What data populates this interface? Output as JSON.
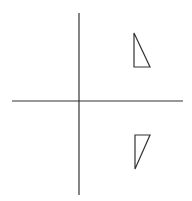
{
  "diagram": {
    "type": "coordinate-reflection",
    "width": 192,
    "height": 201,
    "stroke_color": "#333333",
    "background": "#ffffff",
    "axes": {
      "origin": [
        79,
        101
      ],
      "x_axis": {
        "from": [
          12,
          101
        ],
        "to": [
          183,
          101
        ]
      },
      "y_axis": {
        "from": [
          79,
          13
        ],
        "to": [
          79,
          195
        ]
      }
    },
    "shapes": [
      {
        "name": "upper-triangle",
        "quadrant": "I",
        "points": [
          [
            134,
            33
          ],
          [
            134,
            67
          ],
          [
            150,
            67
          ]
        ]
      },
      {
        "name": "lower-triangle",
        "quadrant": "IV",
        "points": [
          [
            135,
            135
          ],
          [
            150,
            135
          ],
          [
            135,
            169
          ]
        ]
      }
    ]
  }
}
